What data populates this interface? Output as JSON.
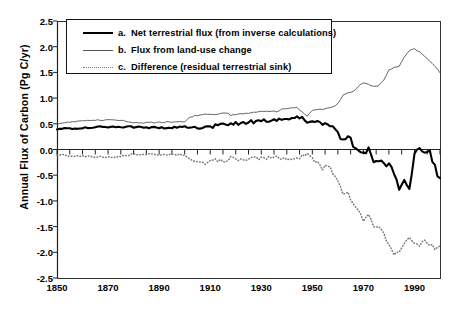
{
  "chart_data": {
    "type": "line",
    "title": "",
    "xlabel": "",
    "ylabel": "Annual Flux of Carbon (Pg C/yr)",
    "xlim": [
      1850,
      2000
    ],
    "ylim": [
      -2.5,
      2.5
    ],
    "xticks": [
      1850,
      1870,
      1890,
      1910,
      1930,
      1950,
      1970,
      1990
    ],
    "yticks": [
      2.5,
      2.0,
      1.5,
      1.0,
      0.5,
      0.0,
      -0.5,
      -1.0,
      -1.5,
      -2.0,
      -2.5
    ],
    "grid": false,
    "legend_position": "top-left",
    "zero_line": 0.0,
    "minor_tick_interval_years": 5,
    "series": [
      {
        "name": "a. Net terrestrial flux (from inverse calculations)",
        "key": "a",
        "style": "solid-thick",
        "color": "#000000",
        "x": [
          1850,
          1855,
          1860,
          1865,
          1870,
          1875,
          1880,
          1885,
          1890,
          1895,
          1900,
          1902,
          1904,
          1906,
          1908,
          1910,
          1912,
          1914,
          1916,
          1918,
          1920,
          1922,
          1924,
          1926,
          1928,
          1930,
          1932,
          1934,
          1936,
          1938,
          1940,
          1942,
          1944,
          1946,
          1948,
          1950,
          1952,
          1954,
          1956,
          1958,
          1960,
          1962,
          1964,
          1966,
          1968,
          1970,
          1972,
          1974,
          1976,
          1978,
          1980,
          1982,
          1984,
          1986,
          1988,
          1990,
          1992,
          1994,
          1996,
          1998,
          2000
        ],
        "values": [
          0.4,
          0.41,
          0.42,
          0.43,
          0.44,
          0.44,
          0.44,
          0.43,
          0.42,
          0.43,
          0.44,
          0.44,
          0.43,
          0.42,
          0.41,
          0.43,
          0.46,
          0.48,
          0.49,
          0.5,
          0.5,
          0.51,
          0.52,
          0.54,
          0.55,
          0.56,
          0.57,
          0.58,
          0.59,
          0.6,
          0.61,
          0.6,
          0.62,
          0.62,
          0.55,
          0.58,
          0.55,
          0.43,
          0.52,
          0.4,
          0.3,
          0.2,
          0.28,
          0.08,
          0.02,
          -0.08,
          0.0,
          -0.25,
          -0.22,
          -0.3,
          -0.28,
          -0.45,
          -0.78,
          -0.6,
          -0.72,
          -0.1,
          0.0,
          -0.02,
          -0.05,
          -0.35,
          -0.6
        ]
      },
      {
        "name": "b. Flux from land-use change",
        "key": "b",
        "style": "solid-thin",
        "color": "#555555",
        "x": [
          1850,
          1855,
          1860,
          1865,
          1870,
          1875,
          1880,
          1885,
          1890,
          1895,
          1900,
          1902,
          1904,
          1906,
          1908,
          1910,
          1912,
          1914,
          1916,
          1918,
          1920,
          1922,
          1924,
          1926,
          1928,
          1930,
          1932,
          1934,
          1936,
          1938,
          1940,
          1942,
          1944,
          1946,
          1948,
          1950,
          1952,
          1954,
          1956,
          1958,
          1960,
          1962,
          1964,
          1966,
          1968,
          1970,
          1972,
          1974,
          1976,
          1978,
          1980,
          1982,
          1984,
          1986,
          1988,
          1990,
          1992,
          1994,
          1996,
          1998,
          2000
        ],
        "values": [
          0.5,
          0.53,
          0.55,
          0.57,
          0.58,
          0.57,
          0.52,
          0.52,
          0.53,
          0.53,
          0.54,
          0.63,
          0.66,
          0.67,
          0.68,
          0.68,
          0.67,
          0.69,
          0.72,
          0.67,
          0.68,
          0.69,
          0.7,
          0.72,
          0.73,
          0.74,
          0.74,
          0.74,
          0.74,
          0.78,
          0.8,
          0.8,
          0.81,
          0.74,
          0.65,
          0.77,
          0.78,
          0.78,
          0.8,
          0.82,
          0.9,
          1.05,
          1.1,
          1.12,
          1.22,
          1.3,
          1.26,
          1.22,
          1.25,
          1.35,
          1.55,
          1.6,
          1.62,
          1.8,
          1.92,
          1.95,
          1.9,
          1.8,
          1.72,
          1.62,
          1.5
        ]
      },
      {
        "name": "c. Difference (residual terrestrial sink)",
        "key": "c",
        "style": "dotted",
        "color": "#777777",
        "x": [
          1850,
          1855,
          1860,
          1865,
          1870,
          1875,
          1880,
          1885,
          1890,
          1895,
          1900,
          1902,
          1904,
          1906,
          1908,
          1910,
          1912,
          1914,
          1916,
          1918,
          1920,
          1922,
          1924,
          1926,
          1928,
          1930,
          1932,
          1934,
          1936,
          1938,
          1940,
          1942,
          1944,
          1946,
          1948,
          1950,
          1952,
          1954,
          1956,
          1958,
          1960,
          1962,
          1964,
          1966,
          1968,
          1970,
          1972,
          1974,
          1976,
          1978,
          1980,
          1982,
          1984,
          1986,
          1988,
          1990,
          1992,
          1994,
          1996,
          1998,
          2000
        ],
        "values": [
          -0.1,
          -0.12,
          -0.13,
          -0.14,
          -0.15,
          -0.14,
          -0.09,
          -0.09,
          -0.11,
          -0.1,
          -0.1,
          -0.19,
          -0.23,
          -0.25,
          -0.27,
          -0.25,
          -0.21,
          -0.21,
          -0.23,
          -0.17,
          -0.18,
          -0.18,
          -0.18,
          -0.18,
          -0.18,
          -0.18,
          -0.17,
          -0.16,
          -0.15,
          -0.18,
          -0.19,
          -0.2,
          -0.19,
          -0.12,
          -0.1,
          -0.19,
          -0.23,
          -0.35,
          -0.28,
          -0.42,
          -0.6,
          -0.85,
          -0.82,
          -1.04,
          -1.2,
          -1.38,
          -1.26,
          -1.47,
          -1.47,
          -1.65,
          -1.83,
          -2.05,
          -2.0,
          -1.85,
          -1.75,
          -1.78,
          -1.85,
          -1.78,
          -1.82,
          -1.9,
          -1.92
        ]
      }
    ]
  },
  "legend": {
    "items": [
      {
        "key": "a.",
        "label": "Net terrestrial flux (from inverse calculations)"
      },
      {
        "key": "b.",
        "label": "Flux from land-use change"
      },
      {
        "key": "c.",
        "label": "Difference (residual terrestrial sink)"
      }
    ]
  }
}
